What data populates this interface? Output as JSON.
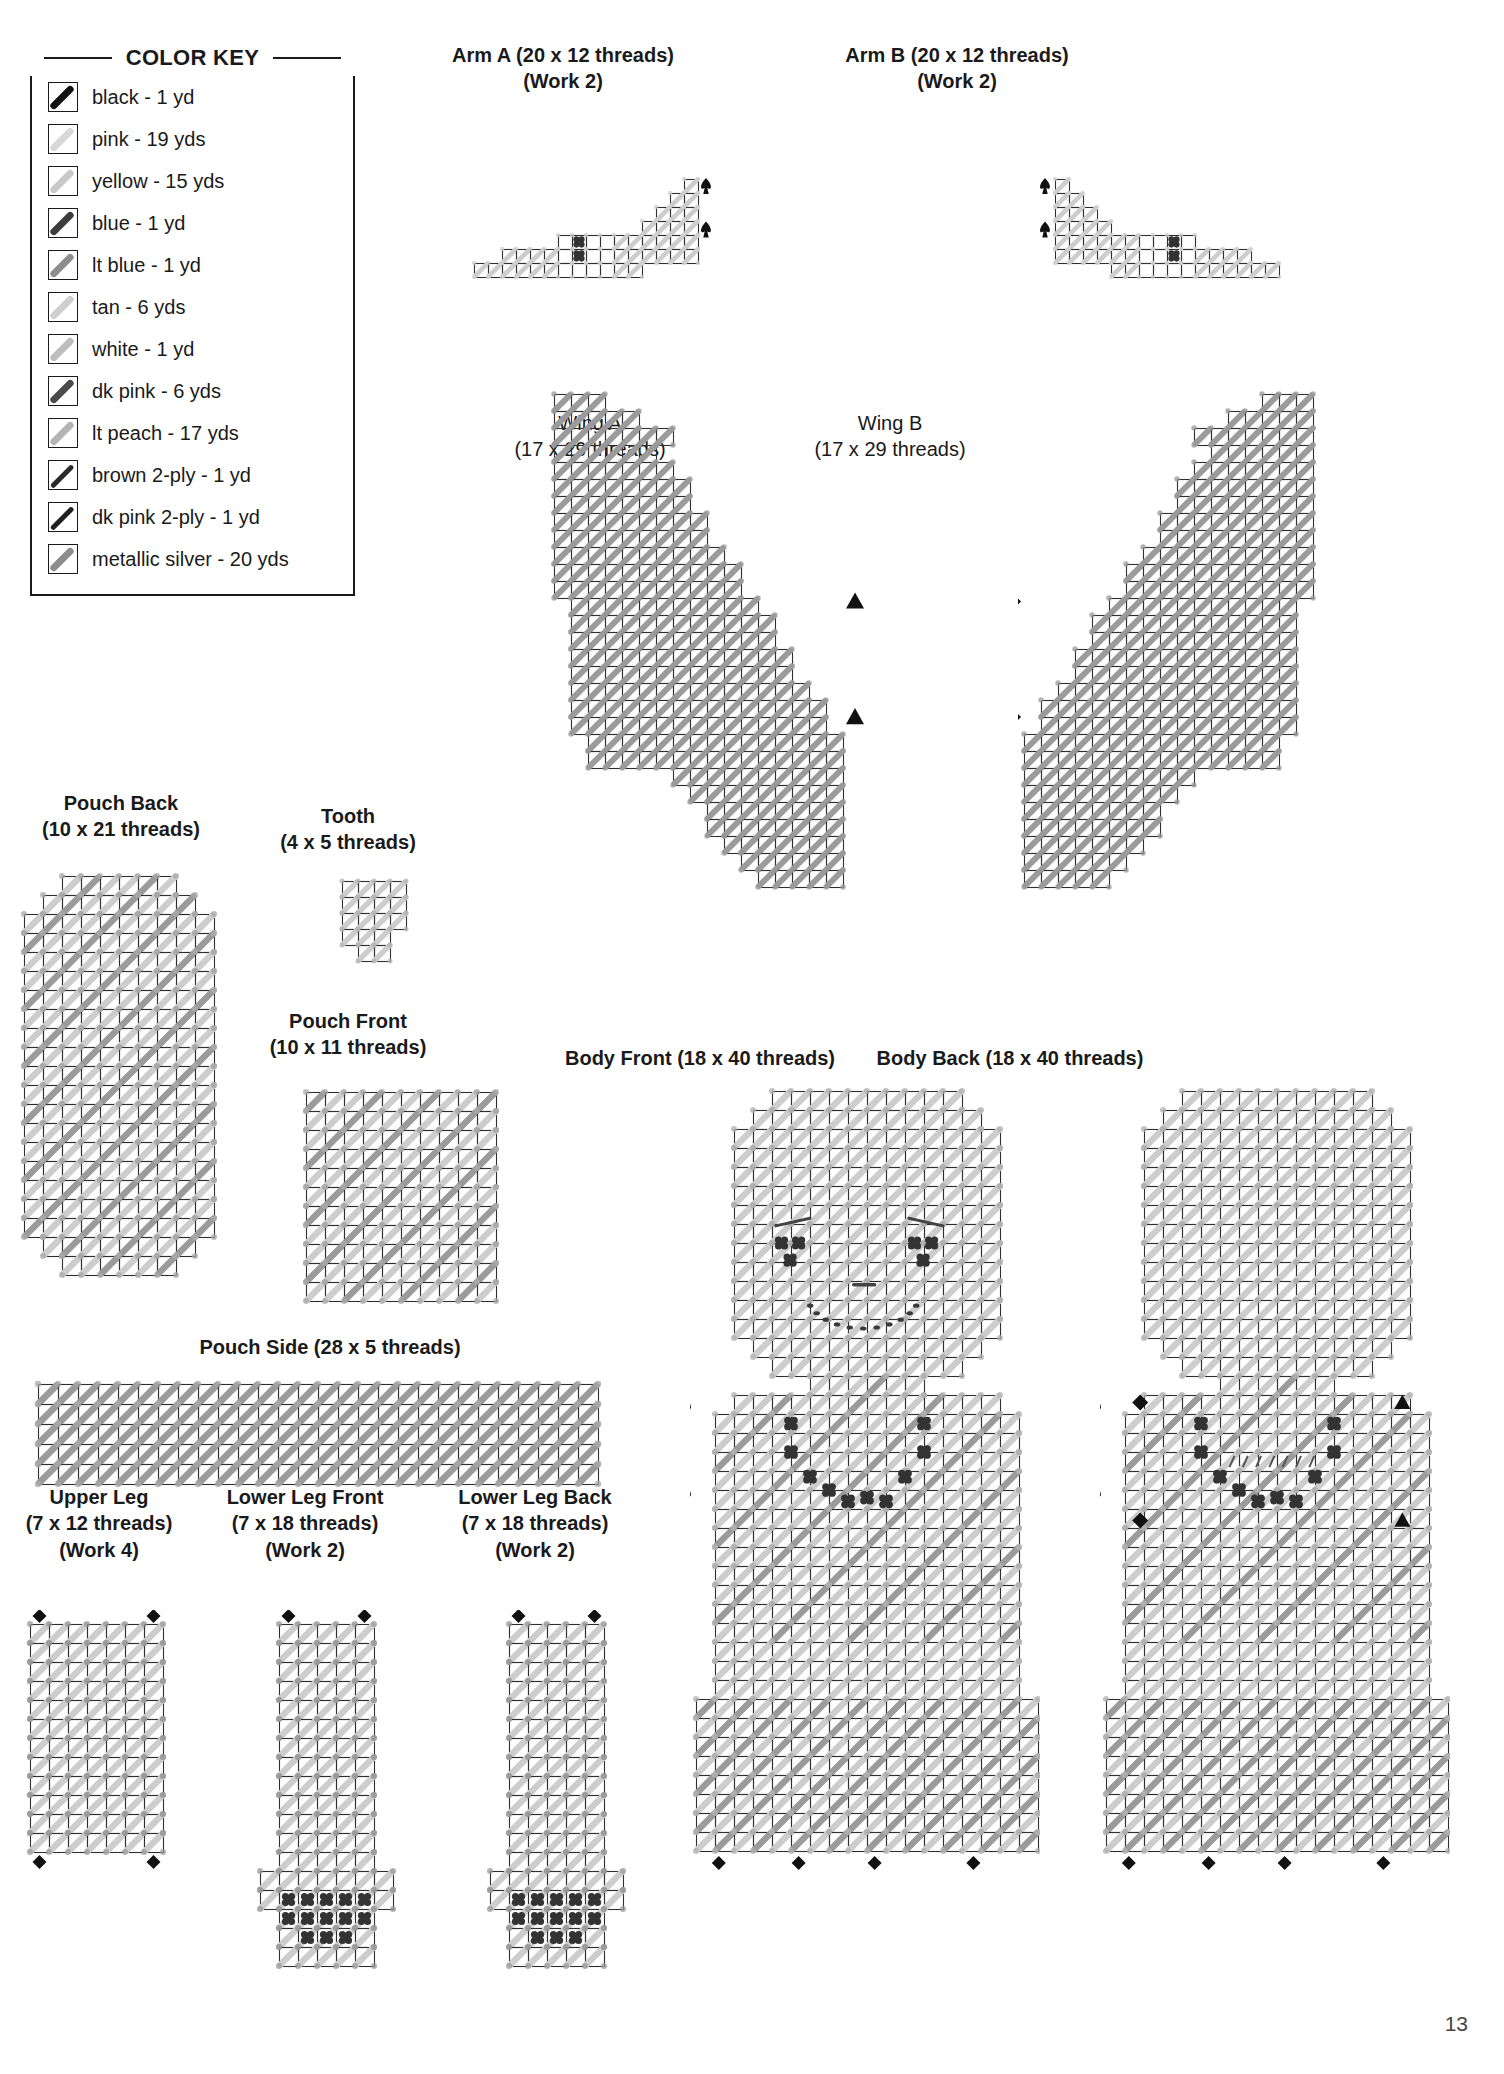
{
  "page": {
    "number": "13",
    "width": 1504,
    "height": 2074
  },
  "color_key": {
    "title": "COLOR KEY",
    "entries": [
      {
        "label": "black - 1 yd",
        "color": "#111111",
        "ply": "full"
      },
      {
        "label": "pink - 19 yds",
        "color": "#d8d8d8",
        "ply": "full"
      },
      {
        "label": "yellow - 15 yds",
        "color": "#c9c9c9",
        "ply": "full"
      },
      {
        "label": "blue - 1 yd",
        "color": "#3c3c3c",
        "ply": "full"
      },
      {
        "label": "lt blue - 1 yd",
        "color": "#8e8e8e",
        "ply": "full"
      },
      {
        "label": "tan - 6 yds",
        "color": "#cfcfcf",
        "ply": "full"
      },
      {
        "label": "white - 1 yd",
        "color": "#bdbdbd",
        "ply": "full"
      },
      {
        "label": "dk pink - 6 yds",
        "color": "#4a4a4a",
        "ply": "full"
      },
      {
        "label": "lt peach - 17 yds",
        "color": "#b4b4b4",
        "ply": "full"
      },
      {
        "label": "brown 2-ply - 1 yd",
        "color": "#2a2a2a",
        "ply": "thin"
      },
      {
        "label": "dk pink 2-ply - 1 yd",
        "color": "#1f1f1f",
        "ply": "thin"
      },
      {
        "label": "metallic silver - 20 yds",
        "color": "#8c8c8c",
        "ply": "full"
      }
    ]
  },
  "charts": [
    {
      "id": "arm-a",
      "title": "Arm A (20 x 12 threads)",
      "subtitle": "(Work 2)",
      "cols": 20,
      "rows": 12
    },
    {
      "id": "arm-b",
      "title": "Arm B (20 x 12 threads)",
      "subtitle": "(Work 2)",
      "cols": 20,
      "rows": 12
    },
    {
      "id": "wing-a",
      "title": "Wing A",
      "subtitle": "(17 x 29 threads)",
      "cols": 17,
      "rows": 29
    },
    {
      "id": "wing-b",
      "title": "Wing B",
      "subtitle": "(17 x 29 threads)",
      "cols": 17,
      "rows": 29
    },
    {
      "id": "pouch-back",
      "title": "Pouch Back",
      "subtitle": "(10 x 21 threads)",
      "cols": 10,
      "rows": 21
    },
    {
      "id": "tooth",
      "title": "Tooth",
      "subtitle": "(4 x 5 threads)",
      "cols": 4,
      "rows": 5
    },
    {
      "id": "pouch-front",
      "title": "Pouch Front",
      "subtitle": "(10 x 11 threads)",
      "cols": 10,
      "rows": 11
    },
    {
      "id": "pouch-side",
      "title": "Pouch Side (28 x 5 threads)",
      "subtitle": "",
      "cols": 28,
      "rows": 5
    },
    {
      "id": "upper-leg",
      "title": "Upper Leg",
      "subtitle": "(7 x 12 threads)",
      "subtitle2": "(Work 4)",
      "cols": 7,
      "rows": 12
    },
    {
      "id": "lower-leg-front",
      "title": "Lower Leg Front",
      "subtitle": "(7 x 18 threads)",
      "subtitle2": "(Work 2)",
      "cols": 7,
      "rows": 18
    },
    {
      "id": "lower-leg-back",
      "title": "Lower Leg Back",
      "subtitle": "(7 x 18 threads)",
      "subtitle2": "(Work 2)",
      "cols": 7,
      "rows": 18
    },
    {
      "id": "body-front",
      "title": "Body Front (18 x 40 threads)",
      "subtitle": "",
      "cols": 18,
      "rows": 40
    },
    {
      "id": "body-back",
      "title": "Body Back (18 x 40 threads)",
      "subtitle": "",
      "cols": 18,
      "rows": 40
    }
  ],
  "chart_data": {
    "type": "table",
    "symbols": {
      "diagonal-stitch": "slanted bar filling one mesh square",
      "french-knot": "dark cluster dot",
      "spade": "join marker (spade glyph)",
      "triangle": "join marker (filled triangle)",
      "diamond": "join marker (filled diamond)"
    },
    "pieces": [
      {
        "name": "Arm A",
        "cols": 20,
        "rows": 12,
        "work": 2,
        "markers": [
          "spade",
          "spade"
        ]
      },
      {
        "name": "Arm B",
        "cols": 20,
        "rows": 12,
        "work": 2,
        "markers": [
          "spade",
          "spade"
        ]
      },
      {
        "name": "Wing A",
        "cols": 17,
        "rows": 29,
        "work": 1,
        "markers": [
          "triangle",
          "triangle"
        ]
      },
      {
        "name": "Wing B",
        "cols": 17,
        "rows": 29,
        "work": 1,
        "markers": [
          "diamond",
          "diamond"
        ]
      },
      {
        "name": "Pouch Back",
        "cols": 10,
        "rows": 21,
        "work": 1,
        "markers": []
      },
      {
        "name": "Tooth",
        "cols": 4,
        "rows": 5,
        "work": 1,
        "markers": []
      },
      {
        "name": "Pouch Front",
        "cols": 10,
        "rows": 11,
        "work": 1,
        "markers": []
      },
      {
        "name": "Pouch Side",
        "cols": 28,
        "rows": 5,
        "work": 1,
        "markers": []
      },
      {
        "name": "Upper Leg",
        "cols": 7,
        "rows": 12,
        "work": 4,
        "markers": [
          "diamond",
          "diamond",
          "diamond",
          "diamond"
        ]
      },
      {
        "name": "Lower Leg Front",
        "cols": 7,
        "rows": 18,
        "work": 2,
        "markers": [
          "diamond",
          "diamond"
        ]
      },
      {
        "name": "Lower Leg Back",
        "cols": 7,
        "rows": 18,
        "work": 2,
        "markers": [
          "diamond",
          "diamond"
        ]
      },
      {
        "name": "Body Front",
        "cols": 18,
        "rows": 40,
        "work": 1,
        "markers": [
          "spade",
          "spade",
          "spade",
          "spade",
          "diamond",
          "diamond",
          "diamond",
          "diamond"
        ]
      },
      {
        "name": "Body Back",
        "cols": 18,
        "rows": 40,
        "work": 1,
        "markers": [
          "spade",
          "spade",
          "spade",
          "spade",
          "diamond",
          "triangle",
          "diamond",
          "triangle",
          "diamond",
          "diamond",
          "diamond",
          "diamond"
        ]
      }
    ]
  }
}
